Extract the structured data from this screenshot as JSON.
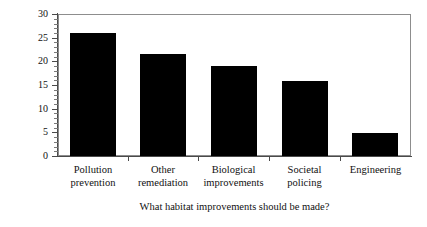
{
  "chart_data": {
    "type": "bar",
    "title": "",
    "subtitle": "",
    "xlabel": "What habitat improvements should be made?",
    "ylabel": "Percent of respondents",
    "categories": [
      "Pollution prevention",
      "Other remediation",
      "Biological improvements",
      "Societal policing",
      "Engineering"
    ],
    "category_lines": [
      [
        "Pollution",
        "prevention"
      ],
      [
        "Other",
        "remediation"
      ],
      [
        "Biological",
        "improvements"
      ],
      [
        "Societal",
        "policing"
      ],
      [
        "Engineering"
      ]
    ],
    "values": [
      26,
      21.5,
      19,
      15.8,
      4.8
    ],
    "ylim": [
      0,
      30
    ],
    "yticks": [
      0,
      5,
      10,
      15,
      20,
      25,
      30
    ],
    "ytick_labels": [
      "0",
      "5",
      "10",
      "15",
      "20",
      "25",
      "30"
    ],
    "yminor_step": 1,
    "grid": false,
    "legend": "none",
    "bar_color": "#000000",
    "axis_color": "#4a4a4a",
    "frame_color": "#8d8d8d",
    "background_color": "#ffffff"
  }
}
